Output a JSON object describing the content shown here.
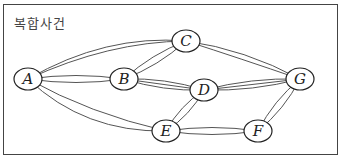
{
  "title": "복합사건",
  "graph": {
    "nodes": [
      {
        "id": "A",
        "label": "A",
        "x": 28,
        "y": 79
      },
      {
        "id": "B",
        "label": "B",
        "x": 124,
        "y": 79
      },
      {
        "id": "C",
        "label": "C",
        "x": 186,
        "y": 41
      },
      {
        "id": "D",
        "label": "D",
        "x": 204,
        "y": 90
      },
      {
        "id": "E",
        "label": "E",
        "x": 166,
        "y": 131
      },
      {
        "id": "F",
        "label": "F",
        "x": 258,
        "y": 131
      },
      {
        "id": "G",
        "label": "G",
        "x": 300,
        "y": 79
      }
    ],
    "edges": [
      {
        "from": "A",
        "to": "C",
        "count": 2
      },
      {
        "from": "A",
        "to": "B",
        "count": 2
      },
      {
        "from": "A",
        "to": "E",
        "count": 2
      },
      {
        "from": "B",
        "to": "C",
        "count": 2
      },
      {
        "from": "B",
        "to": "D",
        "count": 3
      },
      {
        "from": "C",
        "to": "G",
        "count": 2
      },
      {
        "from": "D",
        "to": "G",
        "count": 3
      },
      {
        "from": "D",
        "to": "E",
        "count": 2
      },
      {
        "from": "E",
        "to": "F",
        "count": 2
      },
      {
        "from": "F",
        "to": "G",
        "count": 2
      }
    ]
  },
  "colors": {
    "edge": "#555555",
    "node_stroke": "#222222",
    "frame": "#444444"
  }
}
